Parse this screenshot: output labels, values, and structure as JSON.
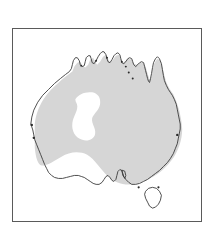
{
  "figure": {
    "kind": "distribution-map",
    "region": "Australia",
    "caption": "",
    "frame": {
      "x": 12,
      "y": 28,
      "width": 190,
      "height": 194,
      "border_color": "#5a5a5a",
      "border_width_px": 1.5,
      "background": "#ffffff"
    }
  },
  "map": {
    "title": "",
    "landmass_label": "Australia",
    "island_label": "Tasmania",
    "coastline_color": "#3a3a3a",
    "coastline_width_px": 0.9,
    "land_fill": "#ffffff",
    "range_fill": "#d6d6d6",
    "range_edge": "#d6d6d6",
    "hole_fill": "#ffffff",
    "legend": [],
    "annotations": []
  },
  "chart_data": {
    "type": "map",
    "projection": "none",
    "title": "",
    "xlabel": "",
    "ylabel": "",
    "viewbox": [
      0,
      0,
      190,
      194
    ],
    "layers": [
      {
        "name": "mainland-coastline",
        "role": "outline",
        "fill": "#ffffff",
        "stroke": "#3a3a3a",
        "path": "M 18 96 L 20 88 L 24 80 L 28 73 L 33 68 L 38 63 L 43 58 L 47 53 L 51 49 L 55 46 L 58 44 L 60 42 L 62 40 L 63 37 L 63 34 L 64 31 L 66 30 L 68 31 L 70 34 L 71 37 L 73 38 L 75 37 L 76 34 L 77 31 L 79 29 L 81 28 L 82 30 L 82 33 L 83 35 L 85 34 L 87 31 L 89 28 L 91 26 L 93 25 L 95 26 L 96 29 L 97 32 L 99 33 L 101 31 L 102 28 L 104 26 L 106 25 L 108 26 L 109 29 L 110 32 L 112 33 L 114 32 L 116 30 L 118 29 L 120 30 L 121 32 L 122 35 L 124 36 L 126 35 L 128 33 L 130 32 L 132 33 L 133 36 L 134 39 L 135 43 L 136 47 L 137 50 L 138 52 L 139 51 L 140 47 L 141 42 L 142 37 L 143 33 L 145 30 L 147 29 L 149 31 L 151 35 L 152 40 L 153 45 L 154 50 L 155 55 L 157 59 L 159 62 L 161 64 L 163 67 L 165 71 L 166 75 L 167 80 L 168 85 L 169 90 L 170 95 L 171 100 L 171 104 L 170 108 L 169 112 L 168 116 L 167 120 L 165 124 L 163 128 L 161 132 L 158 136 L 155 140 L 152 144 L 148 148 L 144 151 L 140 154 L 136 156 L 132 158 L 128 159 L 124 160 L 120 160 L 116 159 L 112 158 L 108 157 L 104 157 L 100 158 L 96 159 L 92 159 L 88 158 L 84 156 L 80 154 L 76 152 L 72 150 L 68 149 L 64 148 L 60 148 L 56 149 L 52 150 L 48 151 L 44 151 L 41 150 L 38 148 L 35 145 L 33 141 L 31 137 L 29 133 L 27 128 L 25 123 L 23 118 L 21 113 L 20 108 L 19 103 L 18 99 Z"
      },
      {
        "name": "distribution-range",
        "role": "shaded-range",
        "fill": "#d6d6d6",
        "stroke": "none",
        "path": "M 22 96 L 25 84 L 30 74 L 36 66 L 43 59 L 50 52 L 57 46 L 62 42 L 64 36 L 68 33 L 72 38 L 77 34 L 81 30 L 84 35 L 89 29 L 94 26 L 97 33 L 102 28 L 107 26 L 110 33 L 115 30 L 120 30 L 123 36 L 128 33 L 133 35 L 136 46 L 139 52 L 142 40 L 146 30 L 150 35 L 154 52 L 159 62 L 164 70 L 168 84 L 170 98 L 169 110 L 166 120 L 162 130 L 156 139 L 149 146 L 141 151 L 132 155 L 122 157 L 112 156 L 102 152 L 94 146 L 88 138 L 82 131 L 75 126 L 67 124 L 58 125 L 50 129 L 43 134 L 36 138 L 30 138 L 26 132 L 23 122 L 22 108 Z"
      },
      {
        "name": "range-hole-interior",
        "role": "unshaded-interior-gap",
        "fill": "#ffffff",
        "stroke": "none",
        "path": "M 62 70 L 70 66 L 78 65 L 85 68 L 88 74 L 86 80 L 82 84 L 80 89 L 82 95 L 83 101 L 80 107 L 74 110 L 67 109 L 62 104 L 60 97 L 61 90 L 64 85 L 64 79 Z"
      },
      {
        "name": "tasmania",
        "role": "island-outline",
        "fill": "#ffffff",
        "stroke": "#3a3a3a",
        "path": "M 136 160 L 140 158 L 145 158 L 149 160 L 151 164 L 150 169 L 148 173 L 145 176 L 142 177 L 139 175 L 137 171 L 135 166 Z"
      }
    ]
  }
}
